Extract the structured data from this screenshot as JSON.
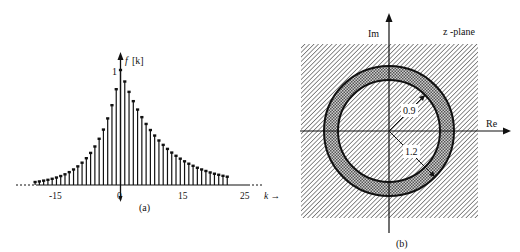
{
  "chart_data": [
    {
      "type": "stem",
      "panel_label": "(a)",
      "title": "",
      "ylabel": "f [k]",
      "xlabel": "k →",
      "x_ticks": [
        -15,
        0,
        15,
        25
      ],
      "y_ticks": [
        1
      ],
      "xlim": [
        -24,
        27
      ],
      "ylim": [
        0,
        1
      ],
      "grid": false,
      "description": "two-sided exponential sequence: f[k] = 0.9^k for k>=0, (1/1.2)^|k| for k<0",
      "x": [
        -20,
        -19,
        -18,
        -17,
        -16,
        -15,
        -14,
        -13,
        -12,
        -11,
        -10,
        -9,
        -8,
        -7,
        -6,
        -5,
        -4,
        -3,
        -2,
        -1,
        0,
        1,
        2,
        3,
        4,
        5,
        6,
        7,
        8,
        9,
        10,
        11,
        12,
        13,
        14,
        15,
        16,
        17,
        18,
        19,
        20,
        21,
        22,
        23,
        24,
        25
      ],
      "values": [
        0.026,
        0.031,
        0.038,
        0.045,
        0.054,
        0.065,
        0.078,
        0.093,
        0.112,
        0.135,
        0.162,
        0.194,
        0.233,
        0.279,
        0.335,
        0.402,
        0.482,
        0.579,
        0.694,
        0.833,
        1.0,
        0.9,
        0.81,
        0.729,
        0.656,
        0.59,
        0.531,
        0.478,
        0.43,
        0.387,
        0.349,
        0.314,
        0.282,
        0.254,
        0.229,
        0.206,
        0.185,
        0.167,
        0.15,
        0.135,
        0.122,
        0.109,
        0.098,
        0.089,
        0.08,
        0.072
      ]
    },
    {
      "type": "diagram",
      "panel_label": "(b)",
      "title": "z -plane",
      "xlabel": "Re",
      "ylabel": "Im",
      "annotations": [
        "0.9",
        "1.2"
      ],
      "inner_radius": 0.9,
      "outer_radius": 1.2,
      "description": "region of convergence: annulus 0.9 < |z| < 1.2 (cross-hatched) in hatched z-plane"
    }
  ],
  "panel_a": {
    "ylabel_f": "f",
    "ylabel_k": "[k]",
    "y_tick": "1",
    "x_tick_labels": [
      "-15",
      "0",
      "15",
      "25"
    ],
    "xlabel": "k →",
    "caption": "(a)"
  },
  "panel_b": {
    "im_label": "Im",
    "re_label": "Re",
    "plane_label": "z -plane",
    "inner_label": "0.9",
    "outer_label": "1.2",
    "caption": "(b)"
  }
}
